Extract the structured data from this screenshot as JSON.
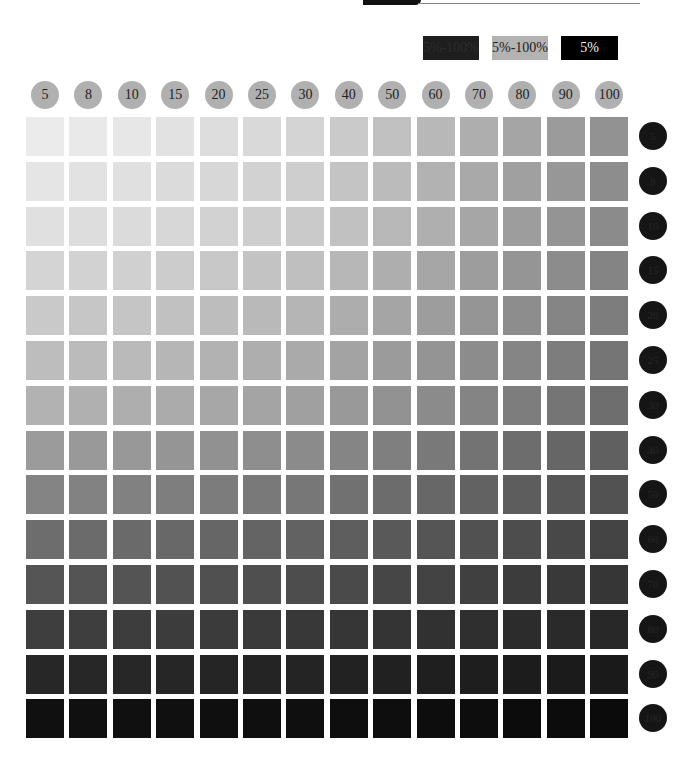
{
  "header": {
    "top_text": "页面装饰文本"
  },
  "legend": [
    {
      "label": "5%-100%",
      "color": "#1e1e1e"
    },
    {
      "label": "5%-100%",
      "color": "#b3b3b3"
    },
    {
      "label": "5%",
      "color": "#000000"
    }
  ],
  "chart_data": {
    "type": "heatmap",
    "title": "",
    "x_labels": [
      "5",
      "8",
      "10",
      "15",
      "20",
      "25",
      "30",
      "40",
      "50",
      "60",
      "70",
      "80",
      "90",
      "100"
    ],
    "y_labels": [
      "5",
      "8",
      "10",
      "15",
      "20",
      "25",
      "30",
      "40",
      "50",
      "60",
      "70",
      "80",
      "90",
      "100"
    ],
    "x_percent": [
      5,
      8,
      10,
      15,
      20,
      25,
      30,
      40,
      50,
      60,
      70,
      80,
      90,
      100
    ],
    "y_percent": [
      5,
      8,
      10,
      15,
      20,
      25,
      30,
      40,
      50,
      60,
      70,
      80,
      90,
      100
    ],
    "legend": [
      "5%-100%",
      "5%-100%",
      "5%"
    ],
    "grid": false
  }
}
